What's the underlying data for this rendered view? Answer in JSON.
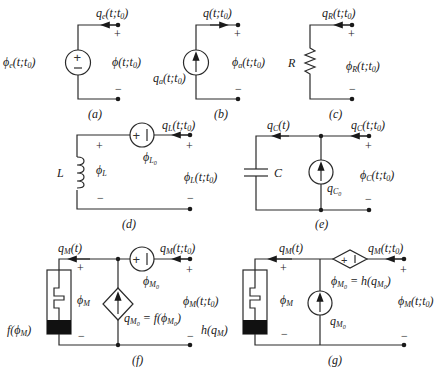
{
  "figure": {
    "panels": [
      {
        "id": "a",
        "caption": "(a)",
        "element": "voltage-source",
        "labels": {
          "current": "q_e(t;t0)",
          "source": "φ_e(t;t0)",
          "voltage": "φ(t;t0)",
          "plus": "+",
          "minus": "−"
        }
      },
      {
        "id": "b",
        "caption": "(b)",
        "element": "current-source",
        "labels": {
          "current": "q(t;t0)",
          "source": "q_a(t;t0)",
          "voltage": "φ_a(t;t0)",
          "plus": "+",
          "minus": "−"
        }
      },
      {
        "id": "c",
        "caption": "(c)",
        "element": "resistor",
        "labels": {
          "current": "q_R(t;t0)",
          "element": "R",
          "voltage": "φ_R(t;t0)",
          "plus": "+",
          "minus": "−"
        }
      },
      {
        "id": "d",
        "caption": "(d)",
        "element": "inductor",
        "labels": {
          "current": "q_L(t;t0)",
          "element": "L",
          "inner_voltage": "φ_L",
          "source": "φ_L0",
          "voltage": "φ_L(t;t0)",
          "plus": "+",
          "minus": "−"
        }
      },
      {
        "id": "e",
        "caption": "(e)",
        "element": "capacitor",
        "labels": {
          "inner_current": "q_C(t)",
          "current": "q_C(t;t0)",
          "element": "C",
          "source": "q_C0",
          "voltage": "φ_C(t;t0)",
          "plus": "+",
          "minus": "−"
        }
      },
      {
        "id": "f",
        "caption": "(f)",
        "element": "memristor",
        "labels": {
          "inner_current": "q_M(t)",
          "current": "q_M(t;t0)",
          "element": "f(φ_M)",
          "inner_voltage": "φ_M",
          "source": "φ_M0",
          "dependent": "q_M0 = f(φ_M0)",
          "voltage": "φ_M(t;t0)",
          "plus": "+",
          "minus": "−"
        }
      },
      {
        "id": "g",
        "caption": "(g)",
        "element": "memristor",
        "labels": {
          "inner_current": "q_M(t)",
          "current": "q_M(t;t0)",
          "element": "h(q_M)",
          "inner_voltage": "φ_M",
          "source": "q_M0",
          "dependent": "φ_M0 = h(q_M0)",
          "voltage": "φ_M(t;t0)",
          "plus": "+",
          "minus": "−"
        }
      }
    ]
  }
}
